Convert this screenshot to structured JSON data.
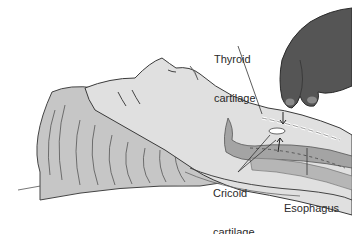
{
  "figure": {
    "labels": {
      "thyroid": {
        "line1": "Thyroid",
        "line2": "cartilage"
      },
      "cricoid": {
        "line1": "Cricoid",
        "line2": "cartilage"
      },
      "esophagus": {
        "line1": "Esophagus"
      }
    },
    "colors": {
      "background": "#ffffff",
      "skin": "#dcdcdc",
      "hair": "#c4c4c4",
      "hand": "#5a5a5a",
      "airway": "#9a9a9a",
      "outline": "#3a3a3a"
    }
  }
}
